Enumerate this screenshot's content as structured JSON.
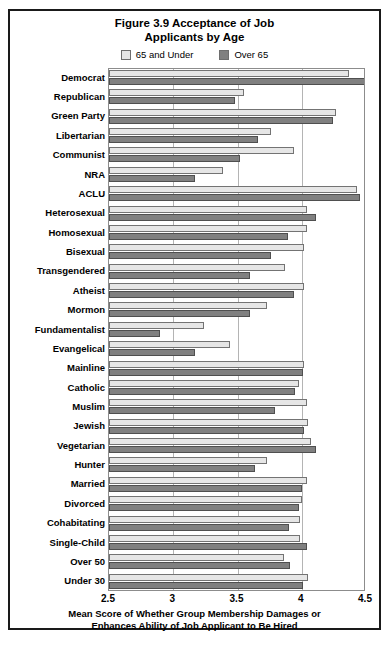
{
  "chart_data": {
    "type": "bar",
    "orientation": "horizontal",
    "title": "Figure 3.9 Acceptance of Job Applicants by Age",
    "title_lines": [
      "Figure 3.9 Acceptance of Job",
      "Applicants by Age"
    ],
    "xlabel": "Mean Score of Whether Group Membership Damages or Enhances Ability of Job Applicant to Be Hired",
    "xlabel_lines": [
      "Mean Score of Whether Group Membership Damages or",
      "Enhances Ability of Job Applicant to Be Hired"
    ],
    "ylabel": "",
    "xlim": [
      2.5,
      4.5
    ],
    "xticks": [
      "2.5",
      "3",
      "3.5",
      "4",
      "4.5"
    ],
    "xtick_values": [
      2.5,
      3,
      3.5,
      4,
      4.5
    ],
    "grid": true,
    "grid_axis": "x",
    "legend_position": "top-center",
    "colors": {
      "65 and Under": "#e6e6e6",
      "Over 65": "#808080",
      "bar_border": "#737373",
      "plot_border": "#8c8c8c",
      "gridline": "#b4b4b4",
      "frame": "#1a1a1a",
      "text": "#000000"
    },
    "categories": [
      "Democrat",
      "Republican",
      "Green Party",
      "Libertarian",
      "Communist",
      "NRA",
      "ACLU",
      "Heterosexual",
      "Homosexual",
      "Bisexual",
      "Transgendered",
      "Atheist",
      "Mormon",
      "Fundamentalist",
      "Evangelical",
      "Mainline",
      "Catholic",
      "Muslim",
      "Jewish",
      "Vegetarian",
      "Hunter",
      "Married",
      "Divorced",
      "Cohabitating",
      "Single-Child",
      "Over 50",
      "Under 30"
    ],
    "series": [
      {
        "name": "65 and Under",
        "color": "#e6e6e6",
        "values": [
          4.37,
          3.55,
          4.27,
          3.76,
          3.94,
          3.39,
          4.43,
          4.04,
          4.04,
          4.02,
          3.87,
          4.02,
          3.73,
          3.24,
          3.44,
          4.02,
          3.98,
          4.04,
          4.05,
          4.07,
          3.73,
          4.04,
          4.0,
          3.99,
          3.99,
          3.86,
          4.05
        ]
      },
      {
        "name": "Over 65",
        "color": "#808080",
        "values": [
          4.5,
          3.48,
          4.24,
          3.66,
          3.52,
          3.17,
          4.45,
          4.11,
          3.89,
          3.76,
          3.6,
          3.94,
          3.6,
          2.9,
          3.17,
          4.01,
          3.95,
          3.79,
          4.02,
          4.11,
          3.64,
          4.0,
          3.98,
          3.9,
          4.04,
          3.91,
          4.01
        ]
      }
    ]
  },
  "legend": {
    "items": [
      {
        "label": "65 and Under",
        "color": "#e6e6e6"
      },
      {
        "label": "Over 65",
        "color": "#808080"
      }
    ]
  }
}
